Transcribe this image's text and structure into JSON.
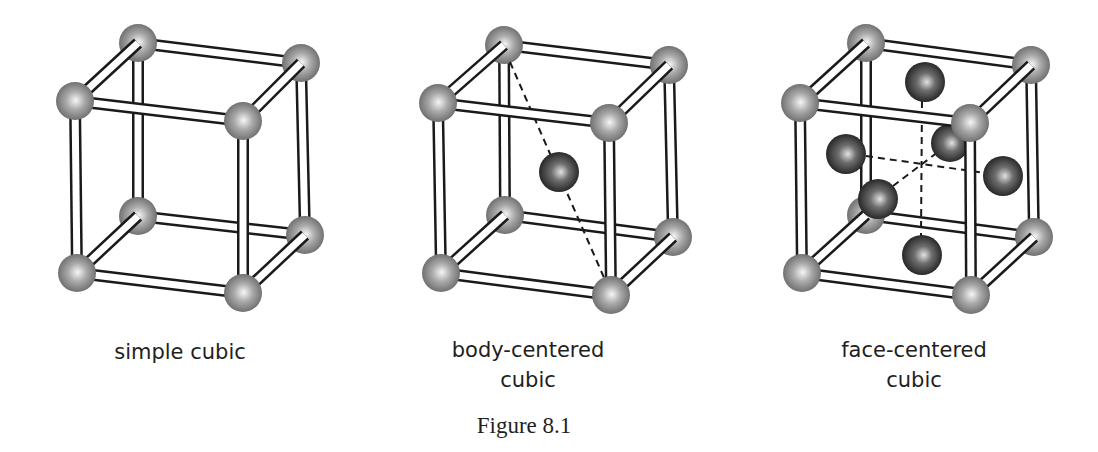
{
  "figure": {
    "title": "Figure 8.1",
    "panels": [
      {
        "id": "simple",
        "label_line1": "simple cubic",
        "label_line2": "",
        "center_x": 180
      },
      {
        "id": "bcc",
        "label_line1": "body-centered",
        "label_line2": "cubic",
        "center_x": 528
      },
      {
        "id": "fcc",
        "label_line1": "face-centered",
        "label_line2": "cubic",
        "center_x": 914
      }
    ]
  },
  "colors": {
    "text": "#231f20",
    "rod_outline": "#1a1a1a",
    "rod_fill": "#ffffff",
    "corner_atom_light": "#f4f4f4",
    "corner_atom_dark": "#6a6a6a",
    "inner_atom_light": "#d8d8d8",
    "inner_atom_dark": "#1e1e1e"
  }
}
